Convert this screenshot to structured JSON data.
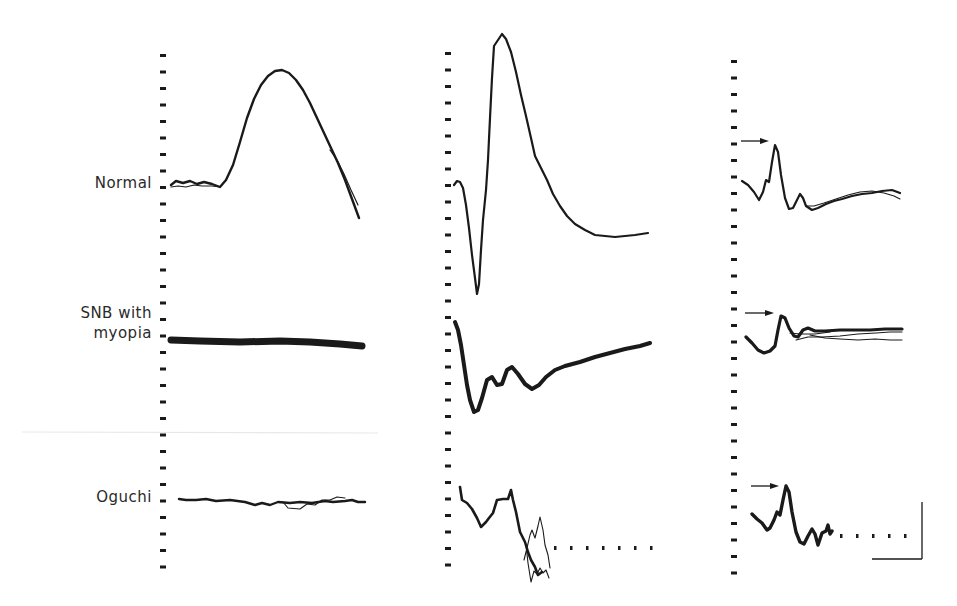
{
  "figure": {
    "row_labels": [
      "Normal",
      "SNB with myopia",
      "Oguchi"
    ],
    "row_label_lines": {
      "normal": [
        "Normal"
      ],
      "snb": [
        "SNB with",
        "myopia"
      ],
      "oguchi": [
        "Oguchi"
      ]
    },
    "columns": 3,
    "tick_marks_per_column": 32,
    "tick_spacing_px": 16.5,
    "calibration_bar": {
      "vertical": true,
      "horizontal": true,
      "labels": []
    },
    "peak_arrows": "column 3, one per row, pointing to first major wave",
    "colors": {
      "trace": "#1a1a1a",
      "background": "#ffffff",
      "divider": "#e6e6e6",
      "label": "#2a2a2a"
    }
  },
  "chart_data": [
    {
      "type": "line",
      "title": "",
      "panel": "column-1",
      "xlabel": "",
      "ylabel": "",
      "grid": false,
      "series": [
        {
          "name": "Normal",
          "shape": "flat baseline then slow large positive wave",
          "baseline_y": 184,
          "peak_y": 70,
          "end_y": 218
        },
        {
          "name": "SNB with myopia",
          "shape": "flat (non-recordable)",
          "baseline_y": 340
        },
        {
          "name": "Oguchi",
          "shape": "flat with noise",
          "baseline_y": 502
        }
      ]
    },
    {
      "type": "line",
      "title": "",
      "panel": "column-2",
      "xlabel": "",
      "ylabel": "",
      "grid": false,
      "series": [
        {
          "name": "Normal",
          "shape": "a-wave trough then large b-wave",
          "a_wave_y": 296,
          "b_wave_y": 33,
          "end_y": 236
        },
        {
          "name": "SNB with myopia",
          "shape": "negative waveform, absent b-wave",
          "trough_y": 416,
          "end_y": 345
        },
        {
          "name": "Oguchi",
          "shape": "reduced, noisy, truncated",
          "start_y": 488,
          "end_y": 580
        }
      ]
    },
    {
      "type": "line",
      "title": "",
      "panel": "column-3",
      "xlabel": "",
      "ylabel": "",
      "grid": false,
      "series": [
        {
          "name": "Normal",
          "shape": "oscillatory potentials / photopic response",
          "peak_y": 142,
          "end_y": 195
        },
        {
          "name": "SNB with myopia",
          "shape": "reduced photopic response",
          "peak_y": 313,
          "end_y": 332
        },
        {
          "name": "Oguchi",
          "shape": "photopic response, truncated",
          "peak_y": 484,
          "end_y": 535
        }
      ]
    }
  ]
}
